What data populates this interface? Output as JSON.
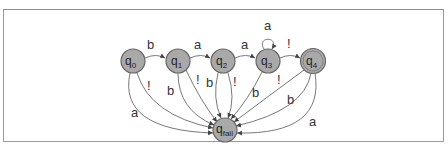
{
  "diagram": {
    "type": "finite-state-automaton",
    "states": [
      {
        "id": "q0",
        "base": "q",
        "sub": "0",
        "accepting": false,
        "x": 133,
        "y": 61
      },
      {
        "id": "q1",
        "base": "q",
        "sub": "1",
        "accepting": false,
        "x": 178,
        "y": 61
      },
      {
        "id": "q2",
        "base": "q",
        "sub": "2",
        "accepting": false,
        "x": 223,
        "y": 61
      },
      {
        "id": "q3",
        "base": "q",
        "sub": "3",
        "accepting": false,
        "x": 268,
        "y": 61
      },
      {
        "id": "q4",
        "base": "q",
        "sub": "4",
        "accepting": true,
        "x": 313,
        "y": 61
      },
      {
        "id": "qfail",
        "base": "q",
        "sub": "fail",
        "accepting": false,
        "x": 225,
        "y": 130
      }
    ],
    "transitions": [
      {
        "from": "q0",
        "to": "q1",
        "label": "b"
      },
      {
        "from": "q1",
        "to": "q2",
        "label": "a"
      },
      {
        "from": "q2",
        "to": "q3",
        "label": "a"
      },
      {
        "from": "q3",
        "to": "q3",
        "label": "a"
      },
      {
        "from": "q3",
        "to": "q4",
        "label": "!"
      },
      {
        "from": "q0",
        "to": "qfail",
        "label": "!"
      },
      {
        "from": "q0",
        "to": "qfail",
        "label": "a"
      },
      {
        "from": "q1",
        "to": "qfail",
        "label": "!"
      },
      {
        "from": "q1",
        "to": "qfail",
        "label": "b"
      },
      {
        "from": "q2",
        "to": "qfail",
        "label": "b"
      },
      {
        "from": "q2",
        "to": "qfail",
        "label": "!"
      },
      {
        "from": "q3",
        "to": "qfail",
        "label": "b"
      },
      {
        "from": "q4",
        "to": "qfail",
        "label": "!"
      },
      {
        "from": "q4",
        "to": "qfail",
        "label": "b"
      },
      {
        "from": "q4",
        "to": "qfail",
        "label": "a"
      }
    ],
    "colors": {
      "node_fill": "#a9a9a9",
      "node_stroke": "#666666",
      "edge": "#555555",
      "frame": "#9a9a9a"
    }
  }
}
